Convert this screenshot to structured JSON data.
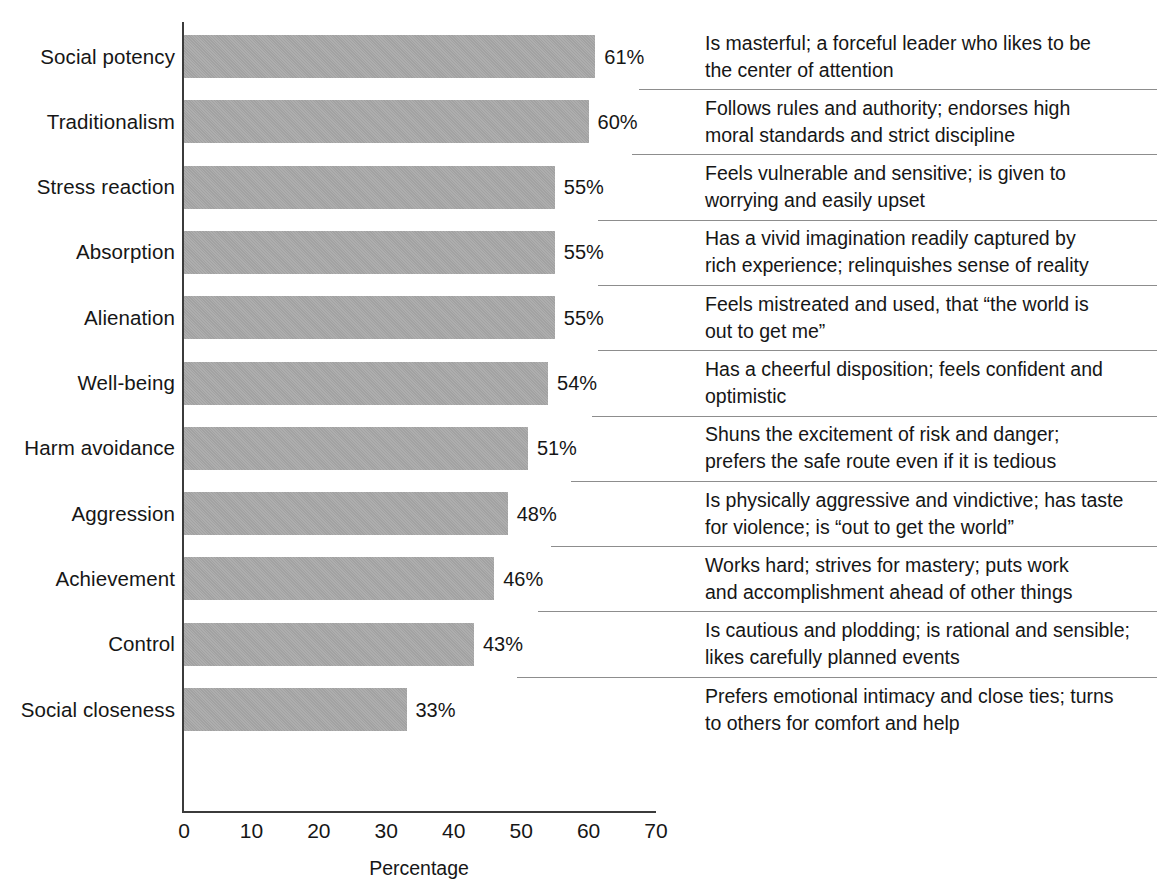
{
  "chart_data": {
    "type": "bar",
    "orientation": "horizontal",
    "title": "",
    "xlabel": "Percentage",
    "ylabel": "",
    "xlim": [
      0,
      70
    ],
    "xticks": [
      0,
      10,
      20,
      30,
      40,
      50,
      60,
      70
    ],
    "grid": false,
    "legend": null,
    "bar_color": "#a9a9a9",
    "axis_color": "#3b3b3b",
    "rule_color": "#8d8d8d",
    "categories": [
      "Social potency",
      "Traditionalism",
      "Stress reaction",
      "Absorption",
      "Alienation",
      "Well-being",
      "Harm avoidance",
      "Aggression",
      "Achievement",
      "Control",
      "Social closeness"
    ],
    "values": [
      61,
      60,
      55,
      55,
      55,
      54,
      51,
      48,
      46,
      43,
      33
    ],
    "value_labels": [
      "61%",
      "60%",
      "55%",
      "55%",
      "55%",
      "54%",
      "51%",
      "48%",
      "46%",
      "43%",
      "33%"
    ],
    "annotations": [
      {
        "category": "Social potency",
        "value": 61,
        "label": "61%",
        "line1": "Is masterful; a forceful leader who likes to be",
        "line2": "the center of attention"
      },
      {
        "category": "Traditionalism",
        "value": 60,
        "label": "60%",
        "line1": "Follows rules and authority; endorses high",
        "line2": "moral standards and strict discipline"
      },
      {
        "category": "Stress reaction",
        "value": 55,
        "label": "55%",
        "line1": "Feels vulnerable and sensitive; is given to",
        "line2": "worrying and easily upset"
      },
      {
        "category": "Absorption",
        "value": 55,
        "label": "55%",
        "line1": "Has a vivid imagination readily captured by",
        "line2": "rich experience; relinquishes sense of reality"
      },
      {
        "category": "Alienation",
        "value": 55,
        "label": "55%",
        "line1": "Feels mistreated and used, that “the world is",
        "line2": "out to get me”"
      },
      {
        "category": "Well-being",
        "value": 54,
        "label": "54%",
        "line1": "Has a cheerful disposition; feels confident and",
        "line2": "optimistic"
      },
      {
        "category": "Harm avoidance",
        "value": 51,
        "label": "51%",
        "line1": "Shuns the excitement of risk and danger;",
        "line2": "prefers the safe route even if it is tedious"
      },
      {
        "category": "Aggression",
        "value": 48,
        "label": "48%",
        "line1": "Is physically aggressive and vindictive; has taste",
        "line2": "for violence; is “out to get the world”"
      },
      {
        "category": "Achievement",
        "value": 46,
        "label": "46%",
        "line1": "Works hard; strives for mastery; puts work",
        "line2": "and accomplishment ahead of other things"
      },
      {
        "category": "Control",
        "value": 43,
        "label": "43%",
        "line1": "Is cautious and plodding; is rational and sensible;",
        "line2": "likes carefully planned events"
      },
      {
        "category": "Social closeness",
        "value": 33,
        "label": "33%",
        "line1": "Prefers emotional intimacy and close ties; turns",
        "line2": "to others for comfort and help"
      }
    ]
  },
  "axis": {
    "x_tick_labels": [
      "0",
      "10",
      "20",
      "30",
      "40",
      "50",
      "60",
      "70"
    ],
    "x_title": "Percentage"
  }
}
